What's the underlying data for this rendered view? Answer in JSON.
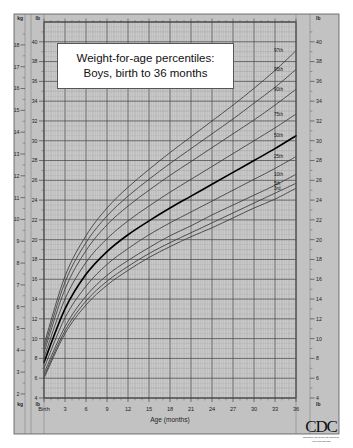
{
  "title": {
    "line1": "Weight-for-age percentiles:",
    "line2": "Boys, birth to 36 months"
  },
  "axes": {
    "left_unit_top_outer": "kg",
    "left_unit_top_inner": "lb",
    "left_unit_bottom_outer": "kg",
    "left_unit_bottom_inner": "lb",
    "right_unit_top": "lb",
    "right_unit_bottom": "lb",
    "x_label": "Age (months)",
    "x_first_tick": "Birth"
  },
  "logo": {
    "mark": "CDC",
    "subtext_line1": "CENTERS FOR DISEASE CONTROL",
    "subtext_line2": "AND PREVENTION"
  },
  "colors": {
    "plot_background": "#c9c9c9",
    "minor_grid": "#9a9a9a",
    "major_grid": "#4a4a4a",
    "curve": "#3a3a3a",
    "median_curve": "#000000",
    "frame": "#555555",
    "axis_strip": "#c2c2c2"
  },
  "chart_data": {
    "type": "line",
    "title": "Weight-for-age percentiles: Boys, birth to 36 months",
    "xlabel": "Age (months)",
    "ylabel": "Weight (lb / kg)",
    "xlim": [
      0,
      36
    ],
    "ylim_lb": [
      4,
      42
    ],
    "ylim_kg": [
      2,
      19
    ],
    "grid": true,
    "legend_position": "right-curve-labels",
    "x_tick_labels": [
      "Birth",
      "3",
      "6",
      "9",
      "12",
      "15",
      "18",
      "21",
      "24",
      "27",
      "30",
      "33",
      "36"
    ],
    "x_tick_values": [
      0,
      3,
      6,
      9,
      12,
      15,
      18,
      21,
      24,
      27,
      30,
      33,
      36
    ],
    "y_tick_labels_lb": [
      "4",
      "6",
      "8",
      "10",
      "12",
      "14",
      "16",
      "18",
      "20",
      "22",
      "24",
      "26",
      "28",
      "30",
      "32",
      "34",
      "36",
      "38",
      "40"
    ],
    "y_tick_values_lb": [
      4,
      6,
      8,
      10,
      12,
      14,
      16,
      18,
      20,
      22,
      24,
      26,
      28,
      30,
      32,
      34,
      36,
      38,
      40
    ],
    "y_tick_labels_kg": [
      "2",
      "3",
      "4",
      "5",
      "6",
      "7",
      "8",
      "9",
      "10",
      "11",
      "12",
      "13",
      "14",
      "15",
      "16",
      "17",
      "18"
    ],
    "y_tick_values_kg": [
      2,
      3,
      4,
      5,
      6,
      7,
      8,
      9,
      10,
      11,
      12,
      13,
      14,
      15,
      16,
      17,
      18
    ],
    "x": [
      0,
      3,
      6,
      9,
      12,
      15,
      18,
      21,
      24,
      27,
      30,
      33,
      36
    ],
    "series": [
      {
        "name": "97th",
        "label": "97th",
        "unit": "lb",
        "values": [
          9.4,
          16.3,
          20.4,
          23.2,
          25.3,
          27.1,
          28.8,
          30.4,
          32.0,
          33.6,
          35.3,
          37.1,
          39.1
        ]
      },
      {
        "name": "95th",
        "label": "95th",
        "unit": "lb",
        "values": [
          9.0,
          15.7,
          19.7,
          22.4,
          24.4,
          26.1,
          27.7,
          29.2,
          30.7,
          32.2,
          33.8,
          35.4,
          37.2
        ]
      },
      {
        "name": "90th",
        "label": "90th",
        "unit": "lb",
        "values": [
          8.6,
          15.0,
          18.9,
          21.5,
          23.4,
          25.0,
          26.5,
          27.9,
          29.3,
          30.7,
          32.1,
          33.6,
          35.2
        ]
      },
      {
        "name": "75th",
        "label": "75th",
        "unit": "lb",
        "values": [
          8.1,
          14.0,
          17.7,
          20.1,
          21.9,
          23.4,
          24.8,
          26.1,
          27.4,
          28.7,
          30.0,
          31.3,
          32.7
        ]
      },
      {
        "name": "50th",
        "label": "50th",
        "unit": "lb",
        "emphasis": true,
        "values": [
          7.6,
          13.0,
          16.5,
          18.8,
          20.5,
          21.9,
          23.2,
          24.4,
          25.6,
          26.8,
          28.0,
          29.2,
          30.5
        ]
      },
      {
        "name": "25th",
        "label": "25th",
        "unit": "lb",
        "values": [
          7.0,
          12.1,
          15.3,
          17.5,
          19.1,
          20.5,
          21.7,
          22.8,
          23.9,
          25.0,
          26.1,
          27.2,
          28.4
        ]
      },
      {
        "name": "10th",
        "label": "10th",
        "unit": "lb",
        "values": [
          6.5,
          11.2,
          14.3,
          16.4,
          17.9,
          19.2,
          20.4,
          21.4,
          22.5,
          23.5,
          24.5,
          25.5,
          26.6
        ]
      },
      {
        "name": "5th",
        "label": "5th",
        "unit": "lb",
        "values": [
          6.2,
          10.8,
          13.8,
          15.8,
          17.3,
          18.6,
          19.7,
          20.7,
          21.7,
          22.7,
          23.7,
          24.7,
          25.7
        ]
      },
      {
        "name": "3rd",
        "label": "3rd",
        "unit": "lb",
        "values": [
          6.0,
          10.5,
          13.4,
          15.4,
          16.9,
          18.2,
          19.3,
          20.3,
          21.2,
          22.2,
          23.2,
          24.1,
          25.2
        ]
      }
    ]
  }
}
